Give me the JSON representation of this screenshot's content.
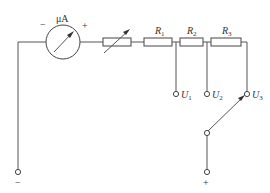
{
  "diagram": {
    "meter": {
      "unit": "μA",
      "minus": "−",
      "plus": "+"
    },
    "rheostat": {
      "label": ""
    },
    "resistors": [
      {
        "name": "R",
        "sub": "1"
      },
      {
        "name": "R",
        "sub": "2"
      },
      {
        "name": "R",
        "sub": "3"
      }
    ],
    "taps": [
      {
        "name": "U",
        "sub": "1"
      },
      {
        "name": "U",
        "sub": "2"
      },
      {
        "name": "U",
        "sub": "3"
      }
    ],
    "terminals": {
      "negative": "−",
      "positive": "+"
    }
  }
}
